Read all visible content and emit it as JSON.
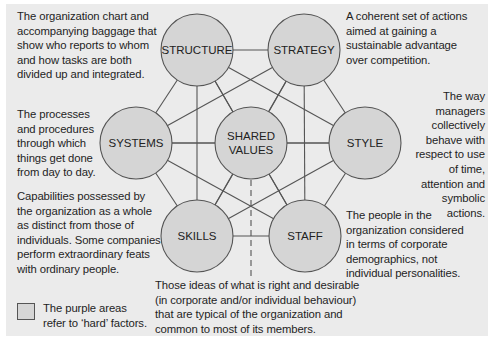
{
  "diagram": {
    "colors": {
      "panel_bg": "#ebebeb",
      "circle_fill": "#d5d5d5",
      "circle_stroke": "#555555",
      "line": "#555555"
    },
    "nodes": [
      {
        "id": "structure",
        "label": "STRUCTURE",
        "cx": 197,
        "cy": 50
      },
      {
        "id": "strategy",
        "label": "STRATEGY",
        "cx": 304,
        "cy": 50
      },
      {
        "id": "systems",
        "label": "SYSTEMS",
        "cx": 136,
        "cy": 143
      },
      {
        "id": "shared_values",
        "label_line1": "SHARED",
        "label_line2": "VALUES",
        "cx": 251,
        "cy": 143
      },
      {
        "id": "style",
        "label": "STYLE",
        "cx": 365,
        "cy": 143
      },
      {
        "id": "skills",
        "label": "SKILLS",
        "cx": 197,
        "cy": 236
      },
      {
        "id": "staff",
        "label": "STAFF",
        "cx": 305,
        "cy": 236
      }
    ],
    "radius": 36,
    "edges": "all pairs connected"
  },
  "descriptions": {
    "structure": "The organization chart and\naccompanying baggage that\nshow who reports to whom\nand how tasks are both\ndivided up and integrated.",
    "strategy": "A coherent set of actions\naimed at gaining a\nsustainable advantage\nover competition.",
    "systems": "The processes\nand procedures\nthrough which\nthings get done\nfrom day to day.",
    "style": "The way\nmanagers\ncollectively\nbehave with\nrespect to use\nof time,\nattention and\nsymbolic\nactions.",
    "skills": "Capabilities possessed by\nthe organization as a whole\nas distinct from those of\nindividuals. Some companies\nperform extraordinary feats\nwith ordinary people.",
    "staff": "The people in the\norganization considered\nin terms of corporate\ndemographics, not\nindividual personalities.",
    "shared_values": "Those ideas of what is right and desirable\n(in corporate and/or individual behaviour)\nthat are typical of the organization and\ncommon to most of its members."
  },
  "legend": {
    "text": "The purple areas\nrefer to ‘hard’ factors."
  }
}
